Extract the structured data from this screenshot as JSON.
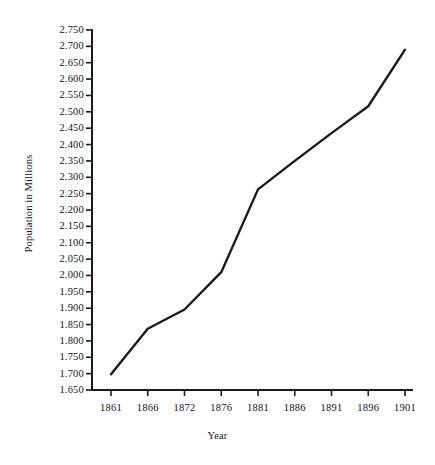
{
  "chart_data": {
    "type": "line",
    "title": "",
    "xlabel": "Year",
    "ylabel": "Population in Millions",
    "x": [
      1861,
      1866,
      1872,
      1876,
      1881,
      1886,
      1891,
      1896,
      1901
    ],
    "categories": [
      "1861",
      "1866",
      "1872",
      "1876",
      "1881",
      "1886",
      "1891",
      "1896",
      "1901"
    ],
    "values": [
      1.698,
      1.837,
      1.896,
      2.01,
      2.263,
      2.35,
      2.435,
      2.517,
      2.69
    ],
    "series": [
      {
        "name": "Population in Millions",
        "values": [
          1.698,
          1.837,
          1.896,
          2.01,
          2.263,
          2.35,
          2.435,
          2.517,
          2.69
        ]
      }
    ],
    "ylim": [
      1.65,
      2.75
    ],
    "ytick_step": 0.05,
    "ytick_labels": [
      "2.750",
      "2.700",
      "2.650",
      "2.600",
      "2.550",
      "2.500",
      "2.450",
      "2.400",
      "2.350",
      "2.300",
      "2.250",
      "2.200",
      "2.150",
      "2.100",
      "2.050",
      "2.000",
      "1.950",
      "1.900",
      "1.850",
      "1.800",
      "1.750",
      "1.700",
      "1.650"
    ],
    "ytick_values": [
      2.75,
      2.7,
      2.65,
      2.6,
      2.55,
      2.5,
      2.45,
      2.4,
      2.35,
      2.3,
      2.25,
      2.2,
      2.15,
      2.1,
      2.05,
      2.0,
      1.95,
      1.9,
      1.85,
      1.8,
      1.75,
      1.7,
      1.65
    ],
    "xtick_labels": [
      "1861",
      "1866",
      "1872",
      "1876",
      "1881",
      "1886",
      "1891",
      "1896",
      "1901"
    ],
    "grid": false,
    "legend": false,
    "legend_position": "none",
    "line_color": "#1b1b1b",
    "axis_color": "#1b1b1b",
    "background_color": "#ffffff",
    "annotations": []
  },
  "layout": {
    "plot_left": 92,
    "plot_right": 412,
    "plot_top": 30,
    "plot_bottom": 390,
    "tick_len": 6,
    "x_first": 111,
    "x_last": 405
  }
}
